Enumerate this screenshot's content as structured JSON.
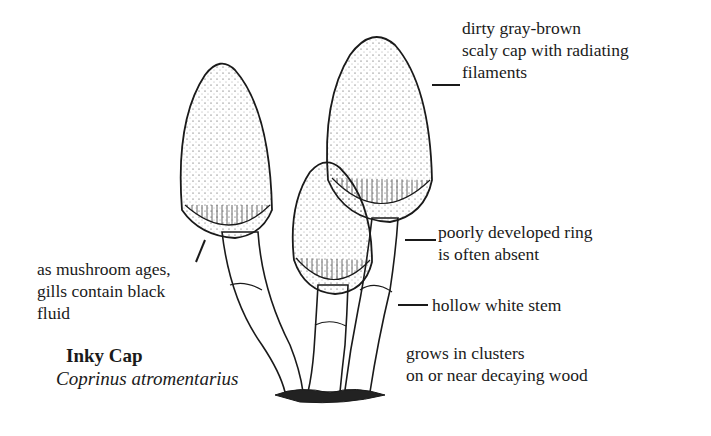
{
  "title": {
    "common_name": "Inky Cap",
    "scientific_name": "Coprinus atromentarius"
  },
  "labels": [
    {
      "id": "cap",
      "lines": [
        "dirty gray-brown",
        "scaly cap with radiating",
        "filaments"
      ]
    },
    {
      "id": "ring",
      "lines": [
        "poorly developed ring",
        "is often absent"
      ]
    },
    {
      "id": "stem",
      "lines": [
        "hollow white stem"
      ]
    },
    {
      "id": "habitat",
      "lines": [
        "grows in clusters",
        "on or  near decaying wood"
      ]
    },
    {
      "id": "gills",
      "lines": [
        "as mushroom ages,",
        "gills contain black",
        "fluid"
      ]
    }
  ],
  "colors": {
    "ink": "#1a1a1a",
    "paper": "#ffffff"
  }
}
